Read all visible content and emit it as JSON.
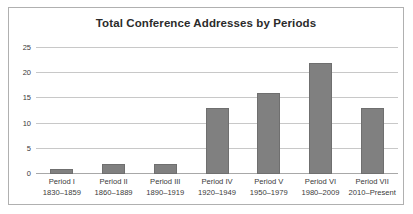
{
  "chart_data": {
    "type": "bar",
    "title": "Total Conference Addresses by Periods",
    "xlabel": "",
    "ylabel": "",
    "ylim": [
      0,
      25
    ],
    "yticks": [
      0,
      5,
      10,
      15,
      20,
      25
    ],
    "grid": true,
    "legend": false,
    "bar_color": "#808080",
    "categories": [
      "Period I",
      "Period II",
      "Period III",
      "Period IV",
      "Period V",
      "Period VI",
      "Period VII"
    ],
    "category_ranges": [
      "1830–1859",
      "1860–1889",
      "1890–1919",
      "1920–1949",
      "1950–1979",
      "1980–2009",
      "2010–Present"
    ],
    "values": [
      1,
      2,
      2,
      13,
      16,
      22,
      13
    ]
  }
}
